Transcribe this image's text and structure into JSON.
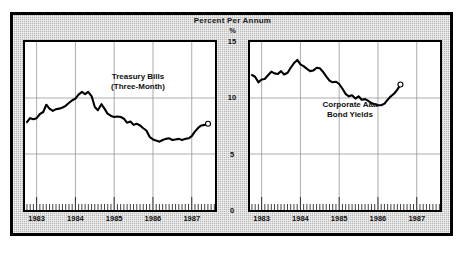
{
  "figure": {
    "title": "Percent Per Annum",
    "unit": "%",
    "background_color": "#b9b9b9",
    "plot_background_color": "#ffffff",
    "line_color": "#000000"
  },
  "y_axis": {
    "ticks": [
      "15",
      "10",
      "5",
      "0"
    ],
    "min": 0,
    "max": 15
  },
  "panels": [
    {
      "id": "left",
      "label_line1": "Treasury Bills",
      "label_line2": "(Three-Month)",
      "x_labels": [
        "1983",
        "1984",
        "1985",
        "1986",
        "1987"
      ]
    },
    {
      "id": "right",
      "label_line1": "Corporate Aaa",
      "label_line2": "Bond Yields",
      "x_labels": [
        "1983",
        "1984",
        "1985",
        "1986",
        "1987"
      ]
    }
  ],
  "chart_data": [
    {
      "type": "line",
      "title": "Treasury Bills (Three-Month)",
      "subtitle": "Percent Per Annum",
      "xlabel": "",
      "ylabel": "%",
      "ylim": [
        0,
        15
      ],
      "xlim": [
        1982.7,
        1987.6
      ],
      "grid": true,
      "legend": "none",
      "x_tick_labels": [
        "1983",
        "1984",
        "1985",
        "1986",
        "1987"
      ],
      "y_tick_labels": [
        "0",
        "5",
        "10",
        "15"
      ],
      "endpoint_marker": "open-circle",
      "x": [
        1982.75,
        1982.83,
        1982.92,
        1983.0,
        1983.08,
        1983.17,
        1983.25,
        1983.33,
        1983.42,
        1983.5,
        1983.58,
        1983.67,
        1983.75,
        1983.83,
        1983.92,
        1984.0,
        1984.08,
        1984.17,
        1984.25,
        1984.33,
        1984.42,
        1984.5,
        1984.58,
        1984.67,
        1984.75,
        1984.83,
        1984.92,
        1985.0,
        1985.08,
        1985.17,
        1985.25,
        1985.33,
        1985.42,
        1985.5,
        1985.58,
        1985.67,
        1985.75,
        1985.83,
        1985.92,
        1986.0,
        1986.08,
        1986.17,
        1986.25,
        1986.33,
        1986.42,
        1986.5,
        1986.58,
        1986.67,
        1986.75,
        1986.83,
        1986.92,
        1987.0,
        1987.08,
        1987.17,
        1987.25,
        1987.33,
        1987.42
      ],
      "y": [
        7.85,
        8.2,
        8.1,
        8.2,
        8.55,
        8.75,
        9.4,
        9.05,
        8.85,
        9.0,
        9.05,
        9.15,
        9.3,
        9.55,
        9.8,
        9.95,
        10.3,
        10.55,
        10.35,
        10.55,
        10.15,
        9.2,
        8.9,
        9.45,
        9.05,
        8.6,
        8.4,
        8.3,
        8.35,
        8.3,
        8.15,
        7.8,
        7.9,
        7.6,
        7.7,
        7.55,
        7.3,
        7.1,
        6.5,
        6.3,
        6.2,
        6.1,
        6.25,
        6.35,
        6.4,
        6.25,
        6.3,
        6.35,
        6.25,
        6.35,
        6.4,
        6.6,
        7.0,
        7.35,
        7.55,
        7.6,
        7.7
      ]
    },
    {
      "type": "line",
      "title": "Corporate Aaa Bond Yields",
      "subtitle": "Percent Per Annum",
      "xlabel": "",
      "ylabel": "%",
      "ylim": [
        0,
        15
      ],
      "xlim": [
        1982.7,
        1987.6
      ],
      "grid": true,
      "legend": "none",
      "x_tick_labels": [
        "1983",
        "1984",
        "1985",
        "1986",
        "1987"
      ],
      "y_tick_labels": [
        "0",
        "5",
        "10",
        "15"
      ],
      "endpoint_marker": "open-circle",
      "x": [
        1982.75,
        1982.83,
        1982.92,
        1983.0,
        1983.08,
        1983.17,
        1983.25,
        1983.33,
        1983.42,
        1983.5,
        1983.58,
        1983.67,
        1983.75,
        1983.83,
        1983.92,
        1984.0,
        1984.08,
        1984.17,
        1984.25,
        1984.33,
        1984.42,
        1984.5,
        1984.58,
        1984.67,
        1984.75,
        1984.83,
        1984.92,
        1985.0,
        1985.08,
        1985.17,
        1985.25,
        1985.33,
        1985.42,
        1985.5,
        1985.58,
        1985.67,
        1985.75,
        1985.83,
        1985.92,
        1986.0,
        1986.08,
        1986.17,
        1986.25,
        1986.33,
        1986.42,
        1986.5,
        1986.58,
        1986.67,
        1986.75,
        1986.83,
        1986.92,
        1987.0,
        1987.08,
        1987.17,
        1987.25,
        1987.33,
        1987.42
      ],
      "y": [
        12.05,
        11.9,
        11.4,
        11.65,
        11.7,
        12.05,
        12.35,
        12.2,
        12.15,
        12.4,
        12.1,
        12.25,
        12.7,
        13.1,
        13.4,
        13.0,
        12.85,
        12.6,
        12.4,
        12.45,
        12.7,
        12.65,
        12.35,
        11.9,
        11.55,
        11.4,
        11.45,
        11.25,
        10.85,
        10.35,
        10.15,
        10.25,
        9.95,
        10.15,
        9.85,
        9.9,
        9.75,
        9.55,
        9.45,
        9.35,
        9.35,
        9.5,
        9.85,
        10.15,
        10.4,
        10.75,
        11.2
      ]
    }
  ]
}
